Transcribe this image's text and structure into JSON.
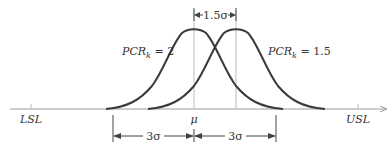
{
  "diagram": {
    "type": "process-capability-normal-curves",
    "colors": {
      "curve": "#3a3a3a",
      "axis": "#9a9a9a",
      "guide": "#b8b8b8",
      "dimension": "#444444",
      "text": "#333333"
    },
    "labels": {
      "lsl": "LSL",
      "usl": "USL",
      "mu": "μ",
      "shift": "1.5σ",
      "left_span": "3σ",
      "right_span": "3σ",
      "curve_left_prefix": "PCR",
      "curve_left_sub": "k",
      "curve_left_value": " = 2",
      "curve_right_prefix": "PCR",
      "curve_right_sub": "k",
      "curve_right_value": " = 1.5"
    },
    "curves": [
      {
        "name": "PCRk = 2",
        "mean_x": 194
      },
      {
        "name": "PCRk = 1.5",
        "mean_x": 236
      }
    ]
  }
}
